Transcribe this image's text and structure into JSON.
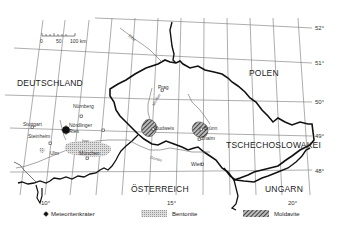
{
  "scale_bar": {
    "ticks": [
      "0",
      "50",
      "100 km"
    ]
  },
  "countries": [
    {
      "name": "DEUTSCHLAND"
    },
    {
      "name": "POLEN"
    },
    {
      "name": "TSCHECHOSLOWAKEI"
    },
    {
      "name": "ÖSTERREICH"
    },
    {
      "name": "UNGARN"
    }
  ],
  "cities": [
    {
      "name": "Nürnberg"
    },
    {
      "name": "Stuttgart"
    },
    {
      "name": "Steinheim"
    },
    {
      "name": "Nördlinger Ries"
    },
    {
      "name": "Ulm"
    },
    {
      "name": "München"
    },
    {
      "name": "Prag"
    },
    {
      "name": "Budweis"
    },
    {
      "name": "Brünn"
    },
    {
      "name": "Znaim"
    },
    {
      "name": "Wien"
    }
  ],
  "rivers": [
    {
      "name": "Elbe"
    },
    {
      "name": "Donau"
    },
    {
      "name": "Isar"
    },
    {
      "name": "Moldau"
    }
  ],
  "latitude_ticks": [
    "52°",
    "51°",
    "50°",
    "49°",
    "48°"
  ],
  "longitude_ticks": [
    "10°",
    "15°",
    "20°"
  ],
  "legend": [
    {
      "symbol": "crater-dot",
      "label": "Meteoritenkrater"
    },
    {
      "symbol": "light-hatch",
      "label": "Bentonite"
    },
    {
      "symbol": "dark-hatch",
      "label": "Moldavite"
    }
  ]
}
